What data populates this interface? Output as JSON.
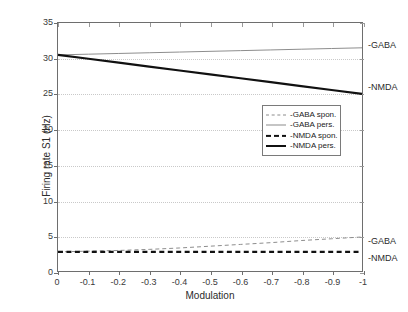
{
  "figure": {
    "background_color": "#ffffff",
    "axis_color": "#6e6e6e",
    "grid_color": "#c9c9c9"
  },
  "axes": {
    "xlabel": "Modulation",
    "ylabel": "Firing rate S1 (Hz)",
    "xticks": [
      "0",
      "-0.1",
      "-0.2",
      "-0.3",
      "-0.4",
      "-0.5",
      "-0.6",
      "-0.7",
      "-0.8",
      "-0.9",
      "-1"
    ],
    "yticks": [
      "0",
      "5",
      "10",
      "15",
      "20",
      "25",
      "30",
      "35"
    ]
  },
  "legend": {
    "position": "center",
    "items": [
      {
        "label": "-GABA spon.",
        "style": "dashed",
        "color": "#8c8c8c",
        "width": 1
      },
      {
        "label": "-GABA pers.",
        "style": "solid",
        "color": "#8c8c8c",
        "width": 1
      },
      {
        "label": "-NMDA spon.",
        "style": "dashed",
        "color": "#111111",
        "width": 2.2
      },
      {
        "label": "-NMDA pers.",
        "style": "solid",
        "color": "#111111",
        "width": 2.2
      }
    ]
  },
  "end_labels": [
    {
      "text": "-GABA",
      "series": "GABA pers.",
      "x": 368,
      "y": 41
    },
    {
      "text": "-NMDA",
      "series": "NMDA pers.",
      "x": 368,
      "y": 83
    },
    {
      "text": "-GABA",
      "series": "GABA spon.",
      "x": 368,
      "y": 237
    },
    {
      "text": "-NMDA",
      "series": "NMDA spon.",
      "x": 368,
      "y": 254
    }
  ],
  "chart_data": {
    "type": "line",
    "title": "",
    "xlabel": "Modulation",
    "ylabel": "Firing rate S1 (Hz)",
    "xlim": [
      0,
      -1
    ],
    "ylim": [
      0,
      35
    ],
    "xticks": [
      0,
      -0.1,
      -0.2,
      -0.3,
      -0.4,
      -0.5,
      -0.6,
      -0.7,
      -0.8,
      -0.9,
      -1
    ],
    "yticks": [
      0,
      5,
      10,
      15,
      20,
      25,
      30,
      35
    ],
    "grid": "horizontal-dotted",
    "legend_position": "center",
    "x": [
      0,
      -0.1,
      -0.2,
      -0.3,
      -0.4,
      -0.5,
      -0.6,
      -0.7,
      -0.8,
      -0.9,
      -1
    ],
    "series": [
      {
        "name": "-GABA spon.",
        "style": "dashed",
        "color": "#8c8c8c",
        "values": [
          2.7,
          2.8,
          2.9,
          3.05,
          3.25,
          3.5,
          3.75,
          4.0,
          4.3,
          4.55,
          4.8
        ]
      },
      {
        "name": "-GABA pers.",
        "style": "solid",
        "color": "#8c8c8c",
        "values": [
          30.5,
          30.6,
          30.7,
          30.8,
          30.9,
          31.0,
          31.1,
          31.2,
          31.3,
          31.4,
          31.5
        ]
      },
      {
        "name": "-NMDA spon.",
        "style": "dashed",
        "color": "#111111",
        "values": [
          2.7,
          2.7,
          2.7,
          2.7,
          2.7,
          2.7,
          2.7,
          2.7,
          2.7,
          2.7,
          2.7
        ]
      },
      {
        "name": "-NMDA pers.",
        "style": "solid",
        "color": "#111111",
        "values": [
          30.5,
          29.95,
          29.4,
          28.85,
          28.3,
          27.75,
          27.2,
          26.65,
          26.1,
          25.55,
          25.0
        ]
      }
    ]
  }
}
